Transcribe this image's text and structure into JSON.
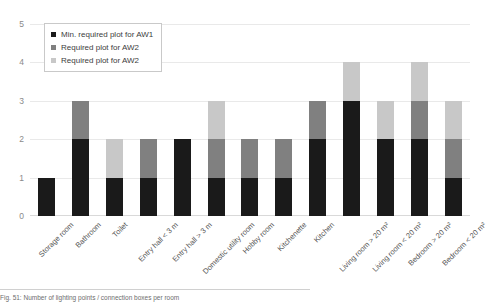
{
  "chart_data": {
    "type": "bar",
    "stacked": true,
    "title": "",
    "xlabel": "",
    "ylabel": "",
    "ylim": [
      0,
      5
    ],
    "yticks": [
      0,
      1,
      2,
      3,
      4,
      5
    ],
    "grid": true,
    "legend_position": "upper-left-inside",
    "categories": [
      "Storage room",
      "Bathroom",
      "Toilet",
      "Entry hall < 3 m",
      "Entry hall > 3 m",
      "Domestic utility room",
      "Hobby room",
      "Kitchenette",
      "Kitchen",
      "Living room > 20 m²",
      "Living room < 20 m²",
      "Bedroom > 20 m²",
      "Bedroom < 20 m²"
    ],
    "series": [
      {
        "name": "Min. required plot for AW1",
        "color": "#1a1a1a",
        "values": [
          1,
          2,
          1,
          1,
          2,
          1,
          1,
          1,
          2,
          3,
          2,
          2,
          1
        ]
      },
      {
        "name": "Required plot for AW2",
        "color": "#808080",
        "values": [
          0,
          1,
          0,
          1,
          0,
          1,
          1,
          1,
          1,
          0,
          0,
          1,
          1
        ]
      },
      {
        "name": "Required plot for AW2",
        "color": "#c8c8c8",
        "values": [
          0,
          0,
          1,
          0,
          0,
          1,
          0,
          0,
          0,
          1,
          1,
          1,
          1
        ]
      }
    ],
    "totals": [
      1,
      3,
      2,
      2,
      2,
      3,
      2,
      2,
      3,
      4,
      3,
      4,
      3
    ]
  },
  "legend": {
    "items": [
      {
        "label": "Min. required plot for AW1",
        "color": "#1a1a1a"
      },
      {
        "label": "Required plot for AW2",
        "color": "#808080"
      },
      {
        "label": "Required plot for AW2",
        "color": "#c8c8c8"
      }
    ]
  },
  "caption": {
    "text": "Fig. 51: Number of lighting points / connection boxes per room"
  }
}
